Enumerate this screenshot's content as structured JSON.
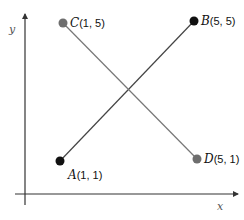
{
  "diagram": {
    "axes": {
      "x_label": "x",
      "y_label": "y",
      "color": "#333333"
    },
    "points": [
      {
        "id": "A",
        "name": "A",
        "coords": "(1, 1)",
        "x": 1,
        "y": 1,
        "color": "#111111"
      },
      {
        "id": "B",
        "name": "B",
        "coords": "(5, 5)",
        "x": 5,
        "y": 5,
        "color": "#111111"
      },
      {
        "id": "C",
        "name": "C",
        "coords": "(1, 5)",
        "x": 1,
        "y": 5,
        "color": "#6e6e6e"
      },
      {
        "id": "D",
        "name": "D",
        "coords": "(5, 1)",
        "x": 5,
        "y": 1,
        "color": "#6e6e6e"
      }
    ],
    "segments": [
      {
        "from": "A",
        "to": "B",
        "color": "#444444"
      },
      {
        "from": "C",
        "to": "D",
        "color": "#777777"
      }
    ]
  }
}
